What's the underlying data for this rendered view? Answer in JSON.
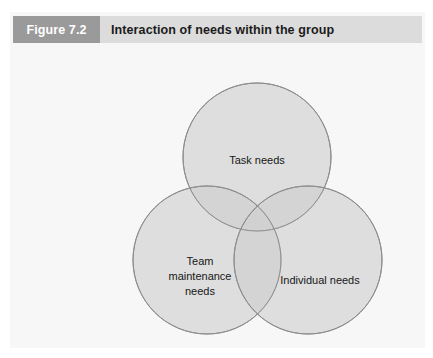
{
  "figure": {
    "number_label": "Figure 7.2",
    "title": "Interaction of needs within the group"
  },
  "diagram": {
    "type": "venn-3-circle",
    "circles": [
      {
        "id": "task-needs",
        "label": "Task needs",
        "label_lines": [
          "Task needs"
        ],
        "position": "top",
        "cx": 247,
        "cy": 114,
        "r": 74
      },
      {
        "id": "team-maintenance-needs",
        "label": "Team maintenance needs",
        "label_lines": [
          "Team",
          "maintenance",
          "needs"
        ],
        "position": "bottom-left",
        "cx": 197,
        "cy": 217,
        "r": 74
      },
      {
        "id": "individual-needs",
        "label": "Individual needs",
        "label_lines": [
          "Individual needs"
        ],
        "position": "bottom-right",
        "cx": 298,
        "cy": 217,
        "r": 74
      }
    ]
  },
  "colors": {
    "panel_background": "#f7f7f8",
    "figure_number_box": "#9a9a9a",
    "figure_number_text": "#ffffff",
    "title_bar": "#dcdcdc",
    "title_text": "#1b1b1b",
    "circle_fill": "#e4e4e4",
    "circle_stroke": "#8d8d8d",
    "overlap_fill": "#d2d2d2",
    "center_overlap_fill": "#bdbdbd",
    "label_text": "#171717"
  }
}
